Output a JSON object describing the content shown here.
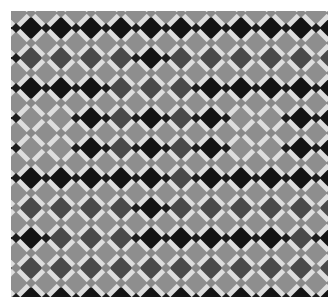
{
  "image": {
    "subject": "Geometric mosaic tile pattern of rotated square tiles in grayscale with small square dots between tiles",
    "palette": {
      "grout": "#dedede",
      "black": "#141414",
      "dark": "#4a4a4a",
      "light": "#8e8e8e",
      "dot_dark": "#1e1e1e",
      "dot_light": "#8a8a8a"
    },
    "dark_lattice_rows": [
      [
        "B",
        "B",
        "B",
        "B",
        "D",
        "B",
        "D",
        "D",
        "B",
        "B",
        "D",
        "B"
      ],
      [
        "B",
        "B",
        "B",
        "B",
        "B",
        "B",
        "B",
        "B",
        "B",
        "B",
        "B",
        "B"
      ],
      [
        "B",
        "D",
        "D",
        "D",
        "D",
        "B",
        "D",
        "D",
        "D",
        "D",
        "D",
        "D"
      ],
      [
        "B",
        "B",
        "B",
        "B",
        "D",
        "D",
        "D",
        "B",
        "B",
        "B",
        "B",
        "B"
      ],
      [
        "B",
        "L",
        "L",
        "B",
        "D",
        "B",
        "D",
        "B",
        "L",
        "L",
        "B",
        "B"
      ],
      [
        "B",
        "L",
        "L",
        "B",
        "D",
        "B",
        "D",
        "B",
        "L",
        "L",
        "B",
        "B"
      ],
      [
        "B",
        "B",
        "B",
        "B",
        "B",
        "B",
        "D",
        "B",
        "B",
        "B",
        "B",
        "B"
      ],
      [
        "D",
        "D",
        "D",
        "D",
        "D",
        "B",
        "D",
        "D",
        "D",
        "D",
        "D",
        "D"
      ],
      [
        "B",
        "B",
        "D",
        "D",
        "D",
        "B",
        "B",
        "B",
        "B",
        "B",
        "D",
        "B"
      ],
      [
        "D",
        "D",
        "D",
        "D",
        "D",
        "D",
        "D",
        "D",
        "D",
        "D",
        "D",
        "D"
      ],
      [
        "B",
        "B",
        "B",
        "B",
        "B",
        "B",
        "B",
        "B",
        "B",
        "B",
        "B",
        "B"
      ]
    ],
    "light_lattice_rows_note": "All half-offset diamonds are light gray"
  }
}
